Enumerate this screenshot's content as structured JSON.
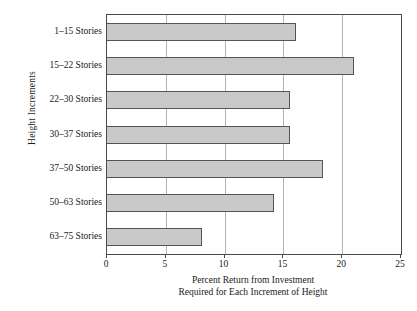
{
  "chart_data": {
    "type": "bar",
    "orientation": "horizontal",
    "title": "",
    "xlabel_lines": [
      "Percent Return from Investment",
      "Required for Each Increment of Height"
    ],
    "ylabel": "Height Increments",
    "categories": [
      "1–15 Stories",
      "15–22 Stories",
      "22–30 Stories",
      "30–37 Stories",
      "37–50 Stories",
      "50–63 Stories",
      "63–75 Stories"
    ],
    "values": [
      16.1,
      21.0,
      15.6,
      15.6,
      18.4,
      14.2,
      8.1
    ],
    "xlim": [
      0,
      25
    ],
    "xticks": [
      0,
      5,
      10,
      15,
      20,
      25
    ],
    "xtick_labels": [
      "0",
      "5",
      "10",
      "15",
      "20",
      "25"
    ],
    "grid": "vertical gridlines at 5, 10, 15, 20",
    "legend": "none",
    "bar_fill_color": "#c9c9c9",
    "bar_border_color": "#555555",
    "gridline_color": "#b4b4b4",
    "axis_color": "#4a4a4a",
    "background_color": "#ffffff"
  }
}
